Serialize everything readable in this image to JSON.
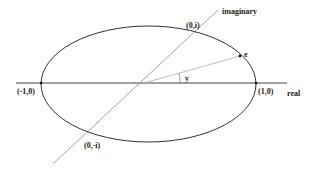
{
  "diagram": {
    "type": "complex-plane-ellipse",
    "axes": {
      "real_label": "real",
      "imaginary_label": "imaginary"
    },
    "points": {
      "left": "(-1,0)",
      "right": "(1,0)",
      "top": "(0,i)",
      "bottom": "(0,-i)",
      "e": "e"
    },
    "angle_label": "y",
    "colors": {
      "ellipse": "#333333",
      "real_axis": "#444444",
      "imaginary_axis": "#999999",
      "ray": "#aaaaaa",
      "text": "#222222"
    }
  }
}
